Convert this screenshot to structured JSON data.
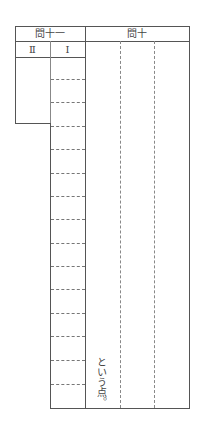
{
  "header": {
    "q11_label": "問十一",
    "q10_label": "問十",
    "sub_II": "Ⅱ",
    "sub_I": "Ⅰ"
  },
  "answer_grid": {
    "q11_I_rows": 15,
    "q10_columns": 3
  },
  "q10_trailing_text": "という点。"
}
